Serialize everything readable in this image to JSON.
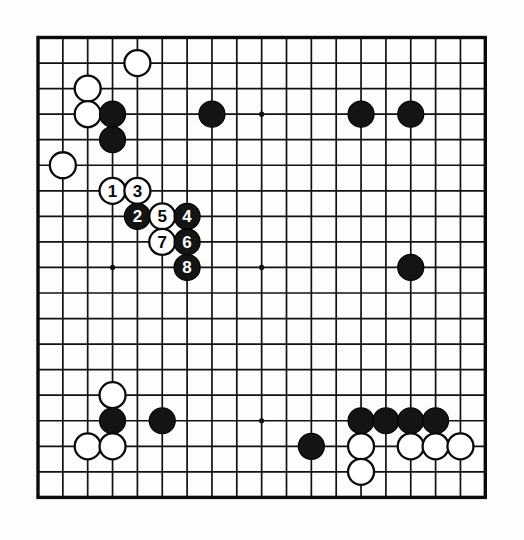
{
  "diagram": {
    "kind": "go-board-diagram",
    "board_size": 19,
    "title": "",
    "background_color": "#fdfdfc",
    "line_color": "#111111",
    "black_color": "#141414",
    "white_color": "#ffffff"
  },
  "geometry": {
    "origin_x": 38,
    "origin_y": 37.5,
    "step_x": 24.85,
    "step_y": 25.55,
    "stone_radius": 13.0,
    "star_radius": 2.6
  },
  "star_points": [
    {
      "col": 3,
      "row": 3
    },
    {
      "col": 9,
      "row": 3
    },
    {
      "col": 15,
      "row": 3
    },
    {
      "col": 3,
      "row": 9
    },
    {
      "col": 9,
      "row": 9
    },
    {
      "col": 15,
      "row": 9
    },
    {
      "col": 3,
      "row": 15
    },
    {
      "col": 9,
      "row": 15
    },
    {
      "col": 15,
      "row": 15
    }
  ],
  "stones": [
    {
      "id": "w-top-d17",
      "color": "white",
      "col": 4,
      "row": 1,
      "label": ""
    },
    {
      "id": "w-c17",
      "color": "white",
      "col": 2,
      "row": 2,
      "label": ""
    },
    {
      "id": "w-c16",
      "color": "white",
      "col": 2,
      "row": 3,
      "label": ""
    },
    {
      "id": "b-d16",
      "color": "black",
      "col": 3,
      "row": 3,
      "label": ""
    },
    {
      "id": "b-d15",
      "color": "black",
      "col": 3,
      "row": 4,
      "label": ""
    },
    {
      "id": "w-b14",
      "color": "white",
      "col": 1,
      "row": 5,
      "label": ""
    },
    {
      "id": "b-h16",
      "color": "black",
      "col": 7,
      "row": 3,
      "label": ""
    },
    {
      "id": "b-n16",
      "color": "black",
      "col": 13,
      "row": 3,
      "label": ""
    },
    {
      "id": "b-p16",
      "color": "black",
      "col": 15,
      "row": 3,
      "label": ""
    },
    {
      "id": "move-1",
      "color": "white",
      "col": 3,
      "row": 6,
      "label": "1"
    },
    {
      "id": "move-3",
      "color": "white",
      "col": 4,
      "row": 6,
      "label": "3"
    },
    {
      "id": "move-2",
      "color": "black",
      "col": 4,
      "row": 7,
      "label": "2"
    },
    {
      "id": "move-5",
      "color": "white",
      "col": 5,
      "row": 7,
      "label": "5"
    },
    {
      "id": "move-4",
      "color": "black",
      "col": 6,
      "row": 7,
      "label": "4"
    },
    {
      "id": "move-7",
      "color": "white",
      "col": 5,
      "row": 8,
      "label": "7"
    },
    {
      "id": "move-6",
      "color": "black",
      "col": 6,
      "row": 8,
      "label": "6"
    },
    {
      "id": "move-8",
      "color": "black",
      "col": 6,
      "row": 9,
      "label": "8"
    },
    {
      "id": "b-p10",
      "color": "black",
      "col": 15,
      "row": 9,
      "label": ""
    },
    {
      "id": "w-d6",
      "color": "white",
      "col": 3,
      "row": 14,
      "label": ""
    },
    {
      "id": "b-d5",
      "color": "black",
      "col": 3,
      "row": 15,
      "label": ""
    },
    {
      "id": "b-f5",
      "color": "black",
      "col": 5,
      "row": 15,
      "label": ""
    },
    {
      "id": "w-c4",
      "color": "white",
      "col": 2,
      "row": 16,
      "label": ""
    },
    {
      "id": "w-d4",
      "color": "white",
      "col": 3,
      "row": 16,
      "label": ""
    },
    {
      "id": "b-l4",
      "color": "black",
      "col": 11,
      "row": 16,
      "label": ""
    },
    {
      "id": "b-n5",
      "color": "black",
      "col": 13,
      "row": 15,
      "label": ""
    },
    {
      "id": "b-o5",
      "color": "black",
      "col": 14,
      "row": 15,
      "label": ""
    },
    {
      "id": "b-p5",
      "color": "black",
      "col": 15,
      "row": 15,
      "label": ""
    },
    {
      "id": "b-q5",
      "color": "black",
      "col": 16,
      "row": 15,
      "label": ""
    },
    {
      "id": "w-n4",
      "color": "white",
      "col": 13,
      "row": 16,
      "label": ""
    },
    {
      "id": "w-p4",
      "color": "white",
      "col": 15,
      "row": 16,
      "label": ""
    },
    {
      "id": "w-q4",
      "color": "white",
      "col": 16,
      "row": 16,
      "label": ""
    },
    {
      "id": "w-r4",
      "color": "white",
      "col": 17,
      "row": 16,
      "label": ""
    },
    {
      "id": "w-n3",
      "color": "white",
      "col": 13,
      "row": 17,
      "label": ""
    }
  ],
  "move_sequence": [
    {
      "number": "1",
      "color": "white"
    },
    {
      "number": "2",
      "color": "black"
    },
    {
      "number": "3",
      "color": "white"
    },
    {
      "number": "4",
      "color": "black"
    },
    {
      "number": "5",
      "color": "white"
    },
    {
      "number": "6",
      "color": "black"
    },
    {
      "number": "7",
      "color": "white"
    },
    {
      "number": "8",
      "color": "black"
    }
  ]
}
